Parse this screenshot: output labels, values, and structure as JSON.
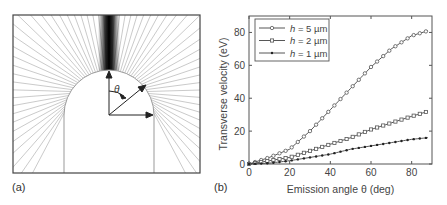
{
  "panel_a": {
    "label": "(a)",
    "angle_symbol": "θ"
  },
  "panel_b": {
    "label": "(b)"
  },
  "chart_data": {
    "type": "line",
    "title": "",
    "xlabel": "Emission angle θ (deg)",
    "ylabel": "Transverse velocity (eV)",
    "xlim": [
      0,
      90
    ],
    "ylim": [
      0,
      90
    ],
    "xticks": [
      0,
      20,
      40,
      60,
      80
    ],
    "yticks": [
      0,
      20,
      40,
      60,
      80
    ],
    "grid": false,
    "legend_position": "upper left",
    "x": [
      0,
      10,
      20,
      30,
      40,
      50,
      60,
      70,
      80,
      88
    ],
    "series": [
      {
        "name": "h = 5 µm",
        "marker": "open-circle",
        "values": [
          0,
          4,
          9,
          20,
          33,
          46,
          59,
          70,
          78,
          81
        ]
      },
      {
        "name": "h = 2 µm",
        "marker": "open-square",
        "values": [
          0,
          2,
          4,
          8,
          12,
          16,
          21,
          25,
          29,
          32
        ]
      },
      {
        "name": "h = 1 µm",
        "marker": "filled-dot",
        "values": [
          0,
          0.5,
          2,
          4,
          6,
          9,
          11,
          13,
          15,
          16
        ]
      }
    ]
  }
}
